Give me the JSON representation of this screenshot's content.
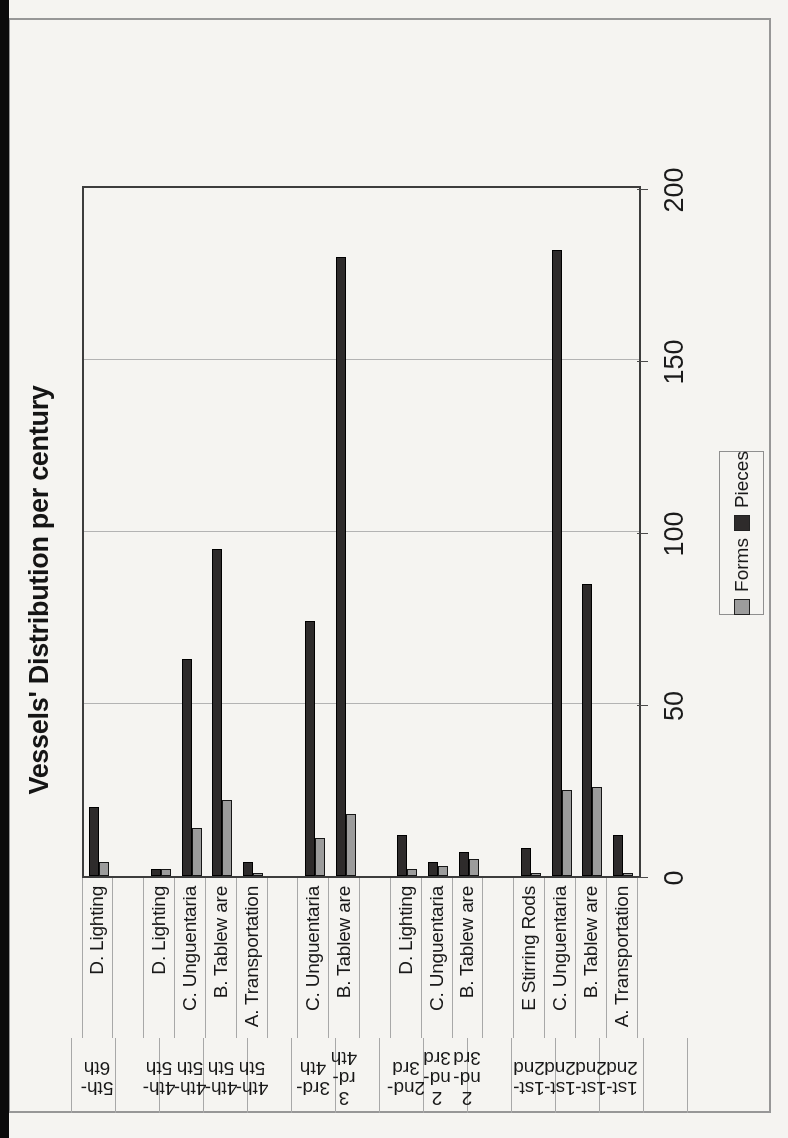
{
  "chart_data": {
    "type": "bar",
    "title": "Vessels' Distribution per century",
    "orientation": "chart rendered landscape, page scanned rotated 90 degrees counterclockwise",
    "value_axis": {
      "ticks": [
        0,
        50,
        100,
        150,
        200
      ],
      "max": 200,
      "grid": true
    },
    "legend": [
      {
        "label": "Forms",
        "color": "#9c9c9c"
      },
      {
        "label": "Pieces",
        "color": "#2e2b2b"
      }
    ],
    "legend_position": "bottom-right",
    "categories": [
      "D. Lighting",
      "D. Lighting",
      "C. Unguentaria",
      "B. Tablew are",
      "A. Transportation",
      "C. Unguentaria",
      "B. Tablew are",
      "D. Lighting",
      "C. Unguentaria",
      "B. Tablew are",
      "E Stirring Rods",
      "C. Unguentaria",
      "B. Tablew are",
      "A. Transportation"
    ],
    "century_labels": [
      "5th-6th",
      "4th-5th",
      "4th-5th",
      "4th-5th",
      "4th-5th",
      "3rd-4th",
      "3rd-4th",
      "2nd-3rd",
      "2nd-3rd",
      "2nd-3rd",
      "1st-2nd",
      "1st-2nd",
      "1st-2nd",
      "1st-2nd"
    ],
    "century_label_lines": [
      [
        "5th-",
        "6th"
      ],
      [
        "4th-",
        "5th"
      ],
      [
        "4th-",
        "5th"
      ],
      [
        "4th-",
        "5th"
      ],
      [
        "4th-",
        "5th"
      ],
      [
        "3rd-",
        "4th"
      ],
      [
        "3",
        "rd-",
        "4th"
      ],
      [
        "2nd-",
        "3rd"
      ],
      [
        "2",
        "nd-",
        "3rd"
      ],
      [
        "2",
        "nd-",
        "3rd"
      ],
      [
        "1st-",
        "2nd"
      ],
      [
        "1st-",
        "2nd"
      ],
      [
        "1st-",
        "2nd"
      ],
      [
        "1st-",
        "2nd"
      ]
    ],
    "slots": [
      0,
      2,
      3,
      4,
      5,
      7,
      8,
      10,
      11,
      12,
      14,
      15,
      16,
      17
    ],
    "total_slots": 18,
    "series": [
      {
        "name": "Pieces",
        "color": "#2e2b2b",
        "values": [
          20,
          2,
          63,
          95,
          4,
          74,
          180,
          12,
          4,
          7,
          8,
          182,
          85,
          12
        ]
      },
      {
        "name": "Forms",
        "color": "#9c9c9c",
        "values": [
          4,
          2,
          14,
          22,
          1,
          11,
          18,
          2,
          3,
          5,
          1,
          25,
          26,
          1
        ]
      }
    ]
  },
  "scan": {
    "paper_color": "#f5f4f1",
    "edge_strip_color": "#0b0b0b",
    "frame_color": "#979797"
  }
}
